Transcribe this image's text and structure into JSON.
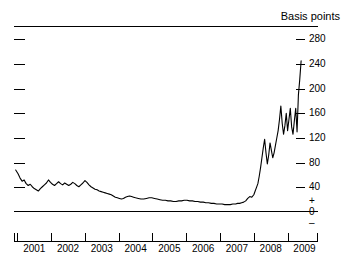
{
  "chart_data": {
    "type": "line",
    "title": "",
    "unit_label": "Basis points",
    "xlabel": "",
    "ylabel": "Basis points",
    "ylim": [
      0,
      300
    ],
    "xlim": [
      2000.4,
      2009.4
    ],
    "grid": false,
    "legend": null,
    "y_ticks": [
      280,
      240,
      200,
      160,
      120,
      80,
      40
    ],
    "y_tick_labels": [
      "280",
      "240",
      "200",
      "160",
      "120",
      "80",
      "40"
    ],
    "zero_label": "0",
    "positive_sign": "+",
    "negative_sign": "–",
    "x_tick_labels": [
      "2001",
      "2002",
      "2003",
      "2004",
      "2005",
      "2006",
      "2007",
      "2008",
      "2009"
    ],
    "x_tick_values": [
      2001,
      2002,
      2003,
      2004,
      2005,
      2006,
      2007,
      2008,
      2009
    ],
    "line_color": "#000000",
    "axis_color": "#000000",
    "series": [
      {
        "name": "Spread",
        "x": [
          2000.45,
          2000.52,
          2000.58,
          2000.64,
          2000.7,
          2000.76,
          2000.82,
          2000.88,
          2000.94,
          2001.0,
          2001.06,
          2001.12,
          2001.18,
          2001.24,
          2001.3,
          2001.36,
          2001.42,
          2001.48,
          2001.54,
          2001.6,
          2001.66,
          2001.72,
          2001.78,
          2001.84,
          2001.9,
          2001.96,
          2002.02,
          2002.08,
          2002.14,
          2002.2,
          2002.26,
          2002.32,
          2002.38,
          2002.44,
          2002.5,
          2002.56,
          2002.62,
          2002.68,
          2002.74,
          2002.8,
          2002.86,
          2002.92,
          2002.98,
          2003.04,
          2003.1,
          2003.16,
          2003.22,
          2003.28,
          2003.34,
          2003.4,
          2003.46,
          2003.52,
          2003.58,
          2003.64,
          2003.7,
          2003.76,
          2003.82,
          2003.88,
          2003.94,
          2004.0,
          2004.08,
          2004.16,
          2004.24,
          2004.32,
          2004.4,
          2004.48,
          2004.56,
          2004.64,
          2004.72,
          2004.8,
          2004.88,
          2004.96,
          2005.04,
          2005.12,
          2005.2,
          2005.28,
          2005.36,
          2005.44,
          2005.52,
          2005.6,
          2005.68,
          2005.76,
          2005.84,
          2005.92,
          2006.0,
          2006.08,
          2006.16,
          2006.24,
          2006.32,
          2006.4,
          2006.48,
          2006.56,
          2006.64,
          2006.72,
          2006.8,
          2006.88,
          2006.96,
          2007.02,
          2007.08,
          2007.14,
          2007.2,
          2007.26,
          2007.32,
          2007.38,
          2007.44,
          2007.5,
          2007.54,
          2007.58,
          2007.62,
          2007.66,
          2007.7,
          2007.74,
          2007.78,
          2007.82,
          2007.86,
          2007.9,
          2007.94,
          2007.98,
          2008.02,
          2008.06,
          2008.1,
          2008.14,
          2008.18,
          2008.22,
          2008.26,
          2008.3,
          2008.34,
          2008.38,
          2008.42,
          2008.46,
          2008.5,
          2008.54,
          2008.58,
          2008.62,
          2008.66,
          2008.7,
          2008.74,
          2008.78,
          2008.82,
          2008.86,
          2008.9
        ],
        "values": [
          68,
          62,
          55,
          50,
          52,
          46,
          43,
          45,
          41,
          38,
          36,
          34,
          38,
          41,
          44,
          47,
          52,
          48,
          45,
          43,
          46,
          49,
          46,
          44,
          47,
          45,
          43,
          45,
          48,
          46,
          43,
          41,
          44,
          47,
          51,
          48,
          44,
          41,
          39,
          37,
          36,
          34,
          33,
          32,
          31,
          30,
          29,
          28,
          26,
          24,
          23,
          22,
          21,
          22,
          24,
          25,
          26,
          25,
          24,
          23,
          22,
          21,
          21,
          22,
          23,
          23,
          22,
          21,
          20,
          19,
          19,
          18,
          18,
          17,
          17,
          18,
          18,
          19,
          19,
          18,
          18,
          17,
          17,
          16,
          16,
          15,
          15,
          14,
          14,
          13,
          13,
          13,
          12,
          12,
          12,
          13,
          13,
          14,
          14,
          15,
          16,
          18,
          22,
          25,
          24,
          28,
          34,
          40,
          46,
          58,
          72,
          88,
          104,
          118,
          96,
          78,
          92,
          112,
          100,
          88,
          96,
          108,
          120,
          132,
          150,
          172,
          144,
          126,
          140,
          160,
          132,
          150,
          168,
          138,
          126,
          148,
          168,
          130,
          190,
          215,
          245
        ]
      }
    ]
  }
}
